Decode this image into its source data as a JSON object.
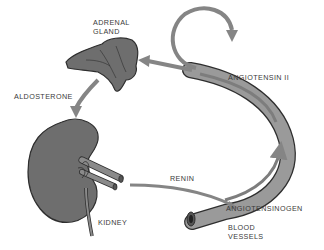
{
  "diagram": {
    "labels": {
      "adrenal_gland_line1": "ADRENAL",
      "adrenal_gland_line2": "GLAND",
      "aldosterone": "ALDOSTERONE",
      "angiotensin_ii": "ANGIOTENSIN II",
      "renin": "RENIN",
      "kidney": "KIDNEY",
      "angiotensinogen": "ANGIOTENSINOGEN",
      "blood_vessels_line1": "BLOOD",
      "blood_vessels_line2": "VESSELS"
    },
    "nodes": [
      {
        "id": "adrenal-gland",
        "label": "ADRENAL GLAND"
      },
      {
        "id": "kidney",
        "label": "KIDNEY"
      },
      {
        "id": "blood-vessels",
        "label": "BLOOD VESSELS"
      }
    ],
    "edges": [
      {
        "from": "kidney",
        "to": "blood-vessels",
        "label": "RENIN"
      },
      {
        "from": "blood-vessels",
        "to": "blood-vessels",
        "label": "ANGIOTENSINOGEN → ANGIOTENSIN II"
      },
      {
        "from": "blood-vessels",
        "to": "adrenal-gland",
        "label": "ANGIOTENSIN II"
      },
      {
        "from": "blood-vessels",
        "to": "blood-vessels",
        "label": "vasoconstriction loop"
      },
      {
        "from": "adrenal-gland",
        "to": "kidney",
        "label": "ALDOSTERONE"
      }
    ],
    "colors": {
      "organ_fill": "#6e6e6e",
      "organ_outline": "#2e2e2e",
      "vessel_fill": "#9a9a9a",
      "vessel_inner": "#7d7d7d",
      "arrow": "#858585",
      "text": "#3a3a3a",
      "background": "#ffffff"
    }
  }
}
